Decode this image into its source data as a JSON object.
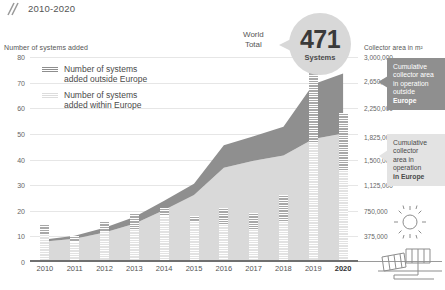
{
  "header": {
    "range": "2010-2020",
    "mark_icon": "double-slash-mark-icon"
  },
  "axes": {
    "left_title": "Number of systems added",
    "right_title": "Collector area in m²",
    "left_ticks": [
      "0",
      "10",
      "20",
      "30",
      "40",
      "50",
      "60",
      "70",
      "80"
    ],
    "left_values": [
      0,
      10,
      20,
      30,
      40,
      50,
      60,
      70,
      80
    ],
    "right_ticks": [
      "375,000",
      "750,000",
      "1,125,000",
      "1,500,000",
      "1,825,000",
      "2,250,000",
      "2,650,000",
      "3,000,000"
    ],
    "right_values": [
      375000,
      750000,
      1125000,
      1500000,
      1825000,
      2250000,
      2650000,
      3000000
    ]
  },
  "legend": {
    "items": [
      {
        "label_line1": "Number of systems",
        "label_line2": "added outside Europe",
        "swatch": "sw-outside",
        "color": "#9a9a9a"
      },
      {
        "label_line1": "Number of systems",
        "label_line2": "added within Europe",
        "swatch": "sw-within",
        "color": "#e4e4e4"
      }
    ]
  },
  "world_total": {
    "label_line1": "World",
    "label_line2": "Total",
    "number": "471",
    "unit": "Systems"
  },
  "callouts": [
    {
      "id": "outside",
      "lines": [
        "Cumulative",
        "collector area",
        "in operation",
        "outside"
      ],
      "bold_line": "Europe",
      "bg": "#8f8f8f",
      "fg": "#ffffff"
    },
    {
      "id": "within",
      "lines": [
        "Cumulative",
        "collector",
        "area in",
        "operation"
      ],
      "bold_line": "in Europe",
      "bg": "#e3e3e3",
      "fg": "#4a4a4a"
    }
  ],
  "solar_icon_name": "sun-and-solar-collector-icon",
  "chart_data": {
    "type": "bar",
    "xlabel": "",
    "ylabel": "Number of systems added",
    "ylabel_right": "Collector area in m²",
    "ylim": [
      0,
      80
    ],
    "ylim_right": [
      0,
      3000000
    ],
    "grid": true,
    "legend_position": "top-left",
    "categories": [
      "2010",
      "2011",
      "2012",
      "2013",
      "2014",
      "2015",
      "2016",
      "2017",
      "2018",
      "2019",
      "2020"
    ],
    "series": [
      {
        "name": "Number of systems added within Europe",
        "type": "bar-stack",
        "color": "#e4e4e4",
        "values": [
          11,
          8,
          12,
          13,
          18,
          16,
          15,
          13,
          16,
          47,
          36
        ]
      },
      {
        "name": "Number of systems added outside Europe",
        "type": "bar-stack",
        "color": "#9a9a9a",
        "values": [
          4,
          2,
          4,
          6,
          3,
          2,
          6,
          6,
          10,
          28,
          22
        ]
      },
      {
        "name": "Cumulative collector area in operation in Europe",
        "type": "area-stack",
        "color": "#d9d9d9",
        "values": [
          300000,
          340000,
          430000,
          560000,
          760000,
          980000,
          1380000,
          1480000,
          1560000,
          1800000,
          1880000
        ]
      },
      {
        "name": "Cumulative collector area in operation outside Europe",
        "type": "area-stack",
        "color": "#8f8f8f",
        "values": [
          30000,
          45000,
          70000,
          100000,
          135000,
          165000,
          330000,
          360000,
          420000,
          800000,
          880000
        ]
      }
    ],
    "annotations": [
      {
        "text": "World Total 471 Systems",
        "kind": "callout-bubble"
      },
      {
        "text": "Cumulative collector area in operation outside Europe",
        "kind": "callout-box"
      },
      {
        "text": "Cumulative collector area in operation in Europe",
        "kind": "callout-box"
      }
    ]
  }
}
